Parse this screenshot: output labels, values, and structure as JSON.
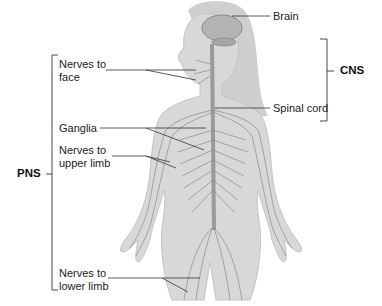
{
  "diagram": {
    "colors": {
      "background": "#ffffff",
      "body_fill": "#d6d6d6",
      "body_shade": "#bdbdbd",
      "nerve": "#7a7a7a",
      "brain": "#a9a9a9",
      "leader_line": "#333333",
      "text": "#222222"
    },
    "groups": {
      "cns": {
        "label": "CNS",
        "members": [
          "Brain",
          "Spinal cord"
        ]
      },
      "pns": {
        "label": "PNS",
        "members": [
          "Nerves to face",
          "Ganglia",
          "Nerves to upper limb",
          "Nerves to lower limb"
        ]
      }
    },
    "labels": {
      "brain": "Brain",
      "spinal_cord": "Spinal cord",
      "nerves_face": "Nerves to face",
      "ganglia": "Ganglia",
      "nerves_upper_limb": "Nerves to upper limb",
      "nerves_lower_limb": "Nerves to lower limb"
    }
  }
}
